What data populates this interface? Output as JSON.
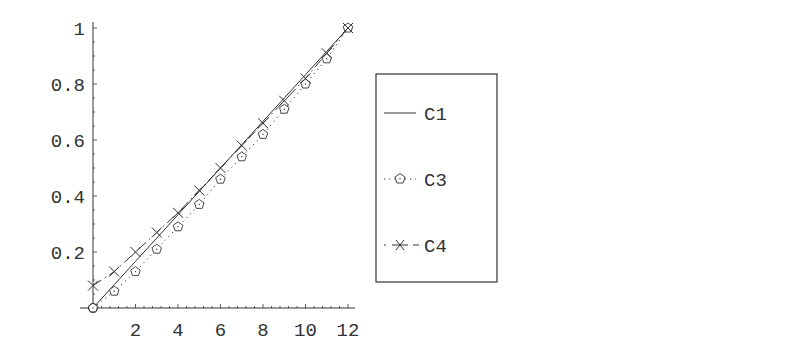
{
  "chart_data": {
    "type": "line",
    "title": "",
    "xlabel": "",
    "ylabel": "",
    "xlim": [
      0,
      12
    ],
    "ylim": [
      0,
      1
    ],
    "grid": false,
    "legend_position": "right (boxed)",
    "x_ticks": [
      "2",
      "4",
      "6",
      "8",
      "10",
      "12"
    ],
    "y_ticks": [
      "0.2",
      "0.4",
      "0.6",
      "0.8",
      "1"
    ],
    "x": [
      0,
      1,
      2,
      3,
      4,
      5,
      6,
      7,
      8,
      9,
      10,
      11,
      12
    ],
    "series": [
      {
        "name": "C1",
        "style": "solid",
        "marker": "none",
        "values": [
          0.0,
          0.0833,
          0.1667,
          0.25,
          0.3333,
          0.4167,
          0.5,
          0.5833,
          0.6667,
          0.75,
          0.8333,
          0.9167,
          1.0
        ]
      },
      {
        "name": "C3",
        "style": "dotted",
        "marker": "pentagon",
        "values": [
          0.0,
          0.06,
          0.13,
          0.21,
          0.29,
          0.37,
          0.46,
          0.54,
          0.62,
          0.71,
          0.8,
          0.89,
          1.0
        ]
      },
      {
        "name": "C4",
        "style": "dash-dot",
        "marker": "x",
        "values": [
          0.08,
          0.13,
          0.2,
          0.27,
          0.34,
          0.42,
          0.5,
          0.58,
          0.66,
          0.74,
          0.82,
          0.91,
          1.0
        ]
      }
    ]
  },
  "legend": {
    "items": [
      {
        "label": "C1"
      },
      {
        "label": "C3"
      },
      {
        "label": "C4"
      }
    ]
  },
  "colors": {
    "ink": "#333333",
    "background": "#ffffff"
  }
}
